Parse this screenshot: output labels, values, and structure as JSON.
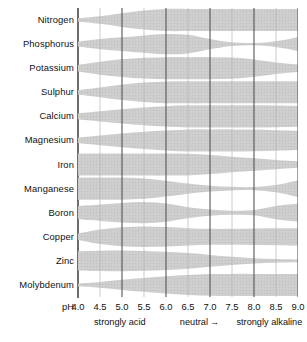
{
  "chart_data": {
    "type": "area",
    "xlabel": "pH",
    "ylabel": "",
    "xlim": [
      4.0,
      9.0
    ],
    "grid": true,
    "legend": "none",
    "x": [
      4.0,
      4.5,
      5.0,
      5.5,
      6.0,
      6.5,
      7.0,
      7.5,
      8.0,
      8.5,
      9.0
    ],
    "tick_labels": [
      "4.0",
      "4.5",
      "5.0",
      "5.5",
      "6.0",
      "6.5",
      "7.0",
      "7.5",
      "8.0",
      "8.5",
      "9.0"
    ],
    "x_prefix": "pH",
    "value_units": "relative availability (band width, 0-1)",
    "series": [
      {
        "name": "Nitrogen",
        "values": [
          0.16,
          0.34,
          0.62,
          0.86,
          1.0,
          1.0,
          1.0,
          1.0,
          1.0,
          1.0,
          1.0
        ]
      },
      {
        "name": "Phosphorus",
        "values": [
          0.22,
          0.46,
          0.62,
          0.78,
          0.92,
          0.84,
          0.46,
          0.16,
          0.1,
          0.26,
          0.62
        ]
      },
      {
        "name": "Potassium",
        "values": [
          0.3,
          0.58,
          0.8,
          0.94,
          1.0,
          1.0,
          1.0,
          0.96,
          0.78,
          0.52,
          0.34
        ]
      },
      {
        "name": "Sulphur",
        "values": [
          0.2,
          0.44,
          0.7,
          0.88,
          0.98,
          1.0,
          1.0,
          1.0,
          1.0,
          1.0,
          1.0
        ]
      },
      {
        "name": "Calcium",
        "values": [
          0.26,
          0.46,
          0.64,
          0.8,
          0.92,
          1.0,
          1.0,
          1.0,
          1.0,
          0.98,
          0.94
        ]
      },
      {
        "name": "Magnesium",
        "values": [
          0.24,
          0.44,
          0.62,
          0.78,
          0.9,
          1.0,
          1.0,
          1.0,
          0.98,
          0.92,
          0.86
        ]
      },
      {
        "name": "Iron",
        "values": [
          1.0,
          1.0,
          1.0,
          1.0,
          1.0,
          0.98,
          0.86,
          0.7,
          0.56,
          0.42,
          0.3
        ]
      },
      {
        "name": "Manganese",
        "values": [
          1.0,
          1.0,
          1.0,
          0.92,
          0.72,
          0.46,
          0.26,
          0.16,
          0.14,
          0.32,
          0.76
        ]
      },
      {
        "name": "Boron",
        "values": [
          0.6,
          0.74,
          0.88,
          0.96,
          0.82,
          0.5,
          0.28,
          0.18,
          0.24,
          0.6,
          0.82
        ]
      },
      {
        "name": "Copper",
        "values": [
          0.3,
          0.66,
          0.86,
          0.92,
          0.88,
          0.78,
          0.72,
          0.72,
          0.74,
          0.76,
          0.78
        ]
      },
      {
        "name": "Zinc",
        "values": [
          0.86,
          0.92,
          0.94,
          0.9,
          0.82,
          0.7,
          0.54,
          0.38,
          0.24,
          0.16,
          0.12
        ]
      },
      {
        "name": "Molybdenum",
        "values": [
          0.12,
          0.26,
          0.46,
          0.62,
          0.78,
          0.9,
          0.98,
          1.0,
          1.0,
          1.0,
          1.0
        ]
      }
    ],
    "annotations": [
      {
        "text": "strongly acid",
        "at_ph": 4.95
      },
      {
        "text": "neutral",
        "at_ph": 6.75,
        "arrow": "→"
      },
      {
        "text": "strongly alkaline",
        "at_ph": 8.35
      }
    ]
  },
  "colors": {
    "band_fill": "#cdcdcd",
    "gridline_major": "#555555",
    "gridline_minor": "#b4b4b4",
    "axis_spine": "#6d6d6d",
    "text": "#111111",
    "background": "#ffffff"
  }
}
